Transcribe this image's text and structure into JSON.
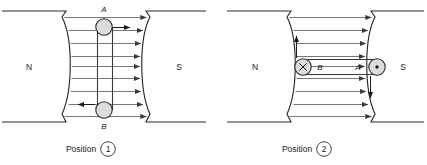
{
  "figure": {
    "background_color": "#ffffff",
    "line_color": "#2b2b2b",
    "field_line_color": "#4a4a4a",
    "conductor_fill": "#dcdcdc"
  },
  "panels": [
    {
      "id": "position-1",
      "caption_label": "Position",
      "caption_number": "1",
      "pole_left_label": "N",
      "pole_right_label": "S",
      "field_line_count": 9,
      "field_direction": "left-to-right",
      "conductors": [
        {
          "id": "A",
          "label": "A",
          "label_position": "above",
          "current_mark": "none",
          "motion_arrow": "right"
        },
        {
          "id": "B",
          "label": "B",
          "label_position": "below",
          "current_mark": "none",
          "motion_arrow": "left"
        }
      ],
      "coil_orientation": "vertical"
    },
    {
      "id": "position-2",
      "caption_label": "Position",
      "caption_number": "2",
      "pole_left_label": "N",
      "pole_right_label": "S",
      "field_line_count": 9,
      "field_direction": "left-to-right",
      "conductors": [
        {
          "id": "B",
          "label": "B",
          "label_position": "right",
          "current_mark": "cross",
          "motion_arrow": "up"
        },
        {
          "id": "A",
          "label": "A",
          "label_position": "left",
          "current_mark": "dot",
          "motion_arrow": "down"
        }
      ],
      "coil_orientation": "horizontal"
    }
  ]
}
